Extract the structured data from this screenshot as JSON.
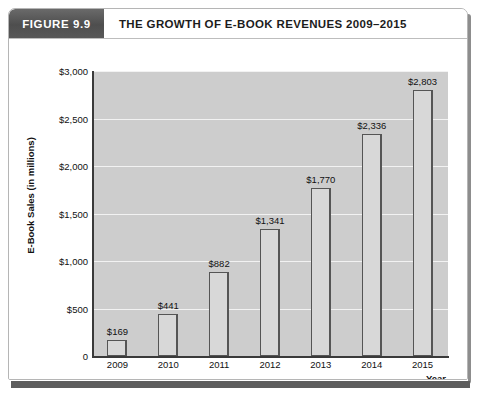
{
  "figure": {
    "number_label": "FIGURE 9.9",
    "title": "THE GROWTH OF E-BOOK REVENUES 2009–2015"
  },
  "colors": {
    "header_box": "#4e4e4e",
    "plot_background": "#cdcdcd",
    "bar_fill": "#d8d8d8",
    "bar_outline": "#555555",
    "gridline": "#f2f2f2",
    "axis": "#3a3a3a",
    "text": "#111111"
  },
  "chart_data": {
    "type": "bar",
    "title": "THE GROWTH OF E-BOOK REVENUES 2009–2015",
    "xlabel": "Year",
    "ylabel": "E-Book Sales (in millions)",
    "categories": [
      "2009",
      "2010",
      "2011",
      "2012",
      "2013",
      "2014",
      "2015"
    ],
    "values": [
      169,
      441,
      882,
      1341,
      1770,
      2336,
      2803
    ],
    "value_labels": [
      "$169",
      "$441",
      "$882",
      "$1,341",
      "$1,770",
      "$2,336",
      "$2,803"
    ],
    "ylim": [
      0,
      3000
    ],
    "ytick_values": [
      0,
      500,
      1000,
      1500,
      2000,
      2500,
      3000
    ],
    "ytick_labels": [
      "0",
      "$500",
      "$1,000",
      "$1,500",
      "$2,000",
      "$2,500",
      "$3,000"
    ],
    "grid": true,
    "legend": null
  }
}
